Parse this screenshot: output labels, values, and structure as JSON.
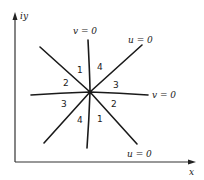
{
  "diagram": {
    "axes": {
      "y_label": "iy",
      "x_label": "x"
    },
    "curves": [
      {
        "id": "v0-vertical",
        "label": "v = 0"
      },
      {
        "id": "u0-rising",
        "label": "u = 0"
      },
      {
        "id": "v0-horizontal",
        "label": "v = 0"
      },
      {
        "id": "u0-falling",
        "label": "u = 0"
      }
    ],
    "regions": {
      "upper_left_top": "1",
      "upper_right_top": "4",
      "left_upper": "2",
      "right_upper": "3",
      "left_lower": "3",
      "right_lower": "2",
      "lower_left": "4",
      "lower_right": "1"
    },
    "colors": {
      "line": "#1a1a1a",
      "axis": "#333333",
      "background": "#ffffff"
    }
  }
}
